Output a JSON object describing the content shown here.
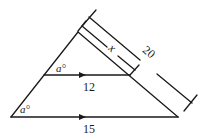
{
  "diagram": {
    "type": "similar-triangles",
    "labels": {
      "top_angle": "a°",
      "bottom_angle": "a°",
      "middle_segment": "12",
      "base_segment": "15",
      "short_side": "x",
      "long_side": "20"
    },
    "colors": {
      "stroke": "#1a1a1a",
      "background": "#ffffff"
    }
  }
}
